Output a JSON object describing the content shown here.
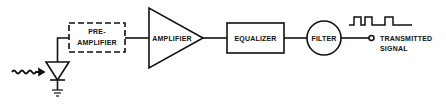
{
  "diagram": {
    "type": "block-diagram",
    "stroke_color": "#111111",
    "background": "#ffffff",
    "blocks": {
      "preamp": {
        "line1": "PRE-",
        "line2": "AMPLIFIER",
        "style": "dashed-box"
      },
      "amplifier": {
        "label": "AMPLIFIER",
        "style": "triangle"
      },
      "equalizer": {
        "label": "EQUALIZER",
        "style": "box"
      },
      "filter": {
        "label": "FILTER",
        "style": "circle"
      }
    },
    "output": {
      "line1": "TRANSMITTED",
      "line2": "SIGNAL"
    },
    "input": {
      "detector": "photodiode",
      "signal": "wavy-arrow (light)"
    },
    "waveform": "square pulse train"
  }
}
